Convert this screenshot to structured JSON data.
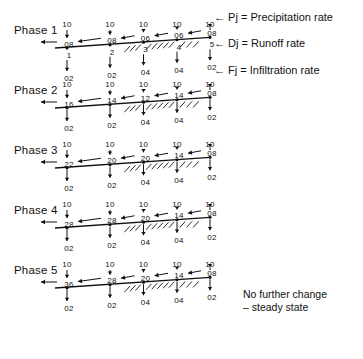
{
  "legend": {
    "items": [
      {
        "symbol": "Pj",
        "eq": "=",
        "label": "Precipitation rate",
        "arrow": "←"
      },
      {
        "symbol": "Dj",
        "eq": "=",
        "label": "Runoff rate",
        "arrow": "←"
      },
      {
        "symbol": "Fj",
        "eq": "=",
        "label": "Infiltration rate",
        "arrow": "←"
      }
    ]
  },
  "note": {
    "line1": "No further change",
    "line2": "– steady state"
  },
  "column_indices": [
    "1",
    "2",
    "3",
    "4",
    "5"
  ],
  "chart_data": {
    "type": "diagram",
    "columns": 5,
    "variables": {
      "P": "Precipitation rate",
      "D": "Runoff rate",
      "F": "Infiltration rate"
    },
    "phases": [
      {
        "label": "Phase 1",
        "precipitation": [
          "10",
          "10",
          "10",
          "10",
          "10"
        ],
        "runoff": [
          "08",
          "08",
          "06",
          "06",
          "08"
        ],
        "infiltration_mid": [
          "02",
          "02",
          "04",
          "04",
          "02"
        ],
        "infiltration_bottom": [
          "02",
          "02",
          "10",
          "10",
          "10"
        ],
        "outflow": "←",
        "saturated_segments": [
          3,
          4
        ]
      },
      {
        "label": "Phase 2",
        "precipitation": [
          "10",
          "10",
          "10",
          "10",
          "10"
        ],
        "runoff": [
          "16",
          "14",
          "12",
          "14",
          "08"
        ],
        "infiltration_mid": [
          "02",
          "02",
          "04",
          "04",
          "02"
        ],
        "infiltration_bottom": [
          "10",
          "10",
          "10",
          "10",
          "10"
        ],
        "outflow": "←",
        "saturated_segments": [
          3,
          4
        ]
      },
      {
        "label": "Phase 3",
        "precipitation": [
          "10",
          "10",
          "10",
          "10",
          "10"
        ],
        "runoff": [
          "22",
          "20",
          "20",
          "14",
          "08"
        ],
        "infiltration_mid": [
          "02",
          "02",
          "04",
          "04",
          "02"
        ],
        "infiltration_bottom": [
          "10",
          "10",
          "10",
          "10",
          "10"
        ],
        "outflow": "←",
        "saturated_segments": [
          3,
          4
        ]
      },
      {
        "label": "Phase 4",
        "precipitation": [
          "10",
          "10",
          "10",
          "10",
          "10"
        ],
        "runoff": [
          "28",
          "28",
          "20",
          "14",
          "08"
        ],
        "infiltration_mid": [
          "02",
          "02",
          "04",
          "04",
          "02"
        ],
        "infiltration_bottom": [
          "10",
          "10",
          "10",
          "10",
          "10"
        ],
        "outflow": "←",
        "saturated_segments": [
          3,
          4
        ]
      },
      {
        "label": "Phase 5",
        "precipitation": [
          "10",
          "10",
          "10",
          "10",
          "10"
        ],
        "runoff": [
          "36",
          "28",
          "20",
          "14",
          "08"
        ],
        "infiltration_mid": [
          "02",
          "02",
          "04",
          "04",
          "02"
        ],
        "infiltration_bottom": [
          "02",
          "02",
          "04",
          "04",
          "02"
        ],
        "outflow": "←",
        "saturated_segments": [
          3,
          4
        ]
      }
    ]
  }
}
